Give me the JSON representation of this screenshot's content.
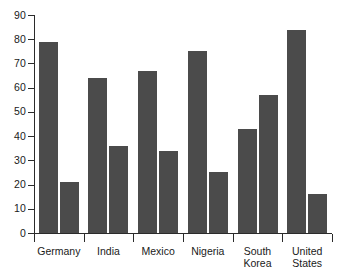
{
  "chart_data": {
    "type": "bar",
    "title": "",
    "subtitle": "",
    "xlabel": "",
    "ylabel": "",
    "categories": [
      "Germany",
      "India",
      "Mexico",
      "Nigeria",
      "South Korea",
      "United States"
    ],
    "series": [
      {
        "name": "series-1",
        "values": [
          79,
          64,
          67,
          75,
          43,
          84
        ]
      },
      {
        "name": "series-2",
        "values": [
          21,
          36,
          34,
          25,
          57,
          16
        ]
      }
    ],
    "ylim": [
      0,
      90
    ],
    "ytick_labels": [
      "90",
      "80",
      "70",
      "60",
      "50",
      "40",
      "30",
      "20",
      "10",
      "0"
    ],
    "ytick_values": [
      90,
      80,
      70,
      60,
      50,
      40,
      30,
      20,
      10,
      0
    ],
    "grid": false,
    "legend": "none",
    "bar_color": "#4b4b4b",
    "axis_color": "#2b2b2b",
    "background_color": "#ffffff"
  },
  "axes": {
    "y_axis_name": "value-axis",
    "x_axis_name": "category-axis"
  }
}
